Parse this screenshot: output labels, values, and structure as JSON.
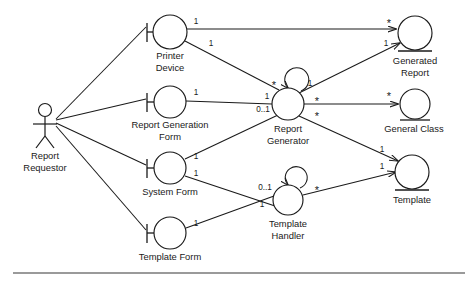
{
  "diagram": {
    "type": "uml-robustness-diagram",
    "stroke_color": "#1a1a1a",
    "background_color": "#ffffff",
    "footer_rule_color": "#9a9a9a",
    "nodes": [
      {
        "id": "report-requestor",
        "label_lines": [
          "Report",
          "Requestor"
        ],
        "stereotype": "actor",
        "x": 45,
        "y": 118
      },
      {
        "id": "printer-device",
        "label_lines": [
          "Printer",
          "Device"
        ],
        "stereotype": "boundary",
        "x": 170,
        "y": 32,
        "r": 17
      },
      {
        "id": "report-generation-form",
        "label_lines": [
          "Report Generation",
          "Form"
        ],
        "stereotype": "boundary",
        "x": 170,
        "y": 102,
        "r": 16
      },
      {
        "id": "system-form",
        "label_lines": [
          "System Form"
        ],
        "stereotype": "boundary",
        "x": 170,
        "y": 168,
        "r": 16
      },
      {
        "id": "template-form",
        "label_lines": [
          "Template Form"
        ],
        "stereotype": "boundary",
        "x": 170,
        "y": 233,
        "r": 16
      },
      {
        "id": "report-generator",
        "label_lines": [
          "Report",
          "Generator"
        ],
        "stereotype": "control",
        "x": 288,
        "y": 104,
        "r": 16
      },
      {
        "id": "template-handler",
        "label_lines": [
          "Template",
          "Handler"
        ],
        "stereotype": "control",
        "x": 288,
        "y": 200,
        "r": 15
      },
      {
        "id": "generated-report",
        "label_lines": [
          "Generated",
          "Report"
        ],
        "stereotype": "entity",
        "x": 415,
        "y": 33,
        "r": 17
      },
      {
        "id": "general-class",
        "label_lines": [
          "General Class"
        ],
        "stereotype": "entity",
        "x": 415,
        "y": 104,
        "r": 15
      },
      {
        "id": "template",
        "label_lines": [
          "Template"
        ],
        "stereotype": "entity",
        "x": 412,
        "y": 172,
        "r": 17
      }
    ],
    "edges": [
      {
        "from": "report-requestor",
        "to": "printer-device",
        "arrow": false
      },
      {
        "from": "report-requestor",
        "to": "report-generation-form",
        "arrow": false
      },
      {
        "from": "report-requestor",
        "to": "system-form",
        "arrow": false
      },
      {
        "from": "report-requestor",
        "to": "template-form",
        "arrow": false
      },
      {
        "from": "printer-device",
        "to": "generated-report",
        "arrow": true
      },
      {
        "from": "printer-device",
        "to": "report-generator",
        "arrow": false
      },
      {
        "from": "report-generation-form",
        "to": "report-generator",
        "arrow": false
      },
      {
        "from": "system-form",
        "to": "report-generator",
        "arrow": false
      },
      {
        "from": "system-form",
        "to": "template-handler",
        "arrow": false
      },
      {
        "from": "template-form",
        "to": "template-handler",
        "arrow": false
      },
      {
        "from": "report-generator",
        "to": "generated-report",
        "arrow": true
      },
      {
        "from": "report-generator",
        "to": "general-class",
        "arrow": true
      },
      {
        "from": "report-generator",
        "to": "template",
        "arrow": true
      },
      {
        "from": "template-handler",
        "to": "template",
        "arrow": true
      },
      {
        "from": "report-generator",
        "to": "report-generator",
        "arrow": true,
        "self_loop": true
      },
      {
        "from": "template-handler",
        "to": "template-handler",
        "arrow": true,
        "self_loop": true
      }
    ],
    "multiplicities": [
      {
        "text": "1",
        "x": 196,
        "y": 22
      },
      {
        "text": "1",
        "x": 211,
        "y": 44
      },
      {
        "text": "*",
        "x": 389,
        "y": 22
      },
      {
        "text": "1",
        "x": 386,
        "y": 44
      },
      {
        "text": "1",
        "x": 196,
        "y": 93
      },
      {
        "text": "*",
        "x": 274,
        "y": 84
      },
      {
        "text": "1",
        "x": 267,
        "y": 97
      },
      {
        "text": "0..1",
        "x": 263,
        "y": 110
      },
      {
        "text": "1",
        "x": 310,
        "y": 84
      },
      {
        "text": "*",
        "x": 317,
        "y": 100
      },
      {
        "text": "*",
        "x": 317,
        "y": 115
      },
      {
        "text": "*",
        "x": 389,
        "y": 95
      },
      {
        "text": "1",
        "x": 196,
        "y": 157
      },
      {
        "text": "1",
        "x": 196,
        "y": 174
      },
      {
        "text": "1",
        "x": 382,
        "y": 150
      },
      {
        "text": "1",
        "x": 382,
        "y": 167
      },
      {
        "text": "0..1",
        "x": 265,
        "y": 188
      },
      {
        "text": "1",
        "x": 262,
        "y": 205
      },
      {
        "text": "*",
        "x": 317,
        "y": 189
      },
      {
        "text": "1",
        "x": 196,
        "y": 224
      }
    ]
  }
}
